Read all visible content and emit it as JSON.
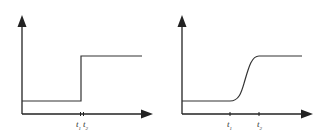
{
  "diagrams": [
    {
      "name": "step-function",
      "curve": "instant step",
      "labels": [
        {
          "t": "t",
          "sub": "1"
        },
        {
          "t": "t",
          "sub": "2"
        }
      ]
    },
    {
      "name": "sigmoid-transition",
      "curve": "smooth S-curve",
      "labels": [
        {
          "t": "t",
          "sub": "1"
        },
        {
          "t": "t",
          "sub": "2"
        }
      ]
    }
  ],
  "colors": {
    "line": "#333333",
    "axis": "#222222"
  }
}
